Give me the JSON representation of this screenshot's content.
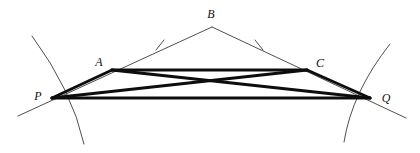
{
  "figure": {
    "background_color": "#ffffff",
    "width": 420,
    "height": 153,
    "stroke_color_thin": "#3b3b3b",
    "stroke_color_thick": "#0d0d0d",
    "thin_width": 0.9,
    "thick_width": 3.0,
    "arc_width": 0.9
  },
  "points": {
    "P": {
      "label": "P",
      "x": 52,
      "y": 98,
      "label_x": 38,
      "label_y": 96
    },
    "A": {
      "label": "A",
      "x": 112,
      "y": 70,
      "label_x": 99,
      "label_y": 62
    },
    "B": {
      "label": "B",
      "x": 212,
      "y": 27,
      "label_x": 211,
      "label_y": 14
    },
    "C": {
      "label": "C",
      "x": 307,
      "y": 70,
      "label_x": 320,
      "label_y": 63
    },
    "Q": {
      "label": "Q",
      "x": 370,
      "y": 98,
      "label_x": 386,
      "label_y": 98
    }
  },
  "thin_lines": [
    {
      "name": "ray-through-P-A-to-B",
      "d": "M 18 116 L 212 27",
      "description": "straight ray from lower-left through P and A up to apex B"
    },
    {
      "name": "ray-through-B-C-to-Q",
      "d": "M 212 27 L 406 118",
      "description": "straight ray from apex B down through C and Q to lower-right"
    }
  ],
  "arcs": [
    {
      "name": "arc-through-P",
      "d": "M 32 36 Q 72 90 84 144",
      "description": "circular arc passing through point P, concave to the right"
    },
    {
      "name": "arc-through-Q",
      "d": "M 390 44 Q 352 92 344 142",
      "description": "circular arc passing through point Q, concave to the left"
    }
  ],
  "tick_marks": [
    {
      "name": "tick-on-AB",
      "d": "M 156 50 L 164 40",
      "description": "congruence tick mark on segment A-B side"
    },
    {
      "name": "tick-on-BC",
      "d": "M 255 40 L 263 50",
      "description": "congruence tick mark on segment B-C side"
    }
  ],
  "thick_segments": [
    {
      "name": "segment-PA",
      "from": "P",
      "to": "A"
    },
    {
      "name": "segment-AC",
      "from": "A",
      "to": "C"
    },
    {
      "name": "segment-CQ",
      "from": "C",
      "to": "Q"
    },
    {
      "name": "segment-PQ",
      "from": "P",
      "to": "Q"
    },
    {
      "name": "segment-AQ",
      "from": "A",
      "to": "Q"
    },
    {
      "name": "segment-PC",
      "from": "P",
      "to": "C"
    }
  ]
}
